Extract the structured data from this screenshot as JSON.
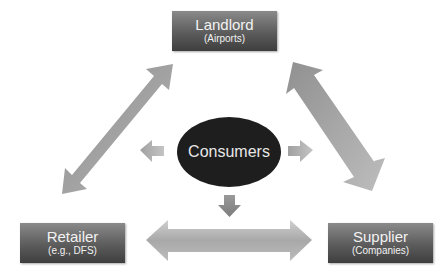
{
  "nodes": {
    "landlord": {
      "title": "Landlord",
      "subtitle": "(Airports)"
    },
    "retailer": {
      "title": "Retailer",
      "subtitle": "(e.g., DFS)"
    },
    "supplier": {
      "title": "Supplier",
      "subtitle": "(Companies)"
    },
    "consumers": {
      "title": "Consumers"
    }
  },
  "edges": [
    {
      "from": "landlord",
      "to": "retailer",
      "type": "bidirectional"
    },
    {
      "from": "landlord",
      "to": "supplier",
      "type": "bidirectional"
    },
    {
      "from": "retailer",
      "to": "supplier",
      "type": "bidirectional"
    },
    {
      "from": "consumers",
      "to": "retailer",
      "type": "directional",
      "direction": "left"
    },
    {
      "from": "consumers",
      "to": "supplier",
      "type": "directional",
      "direction": "right"
    },
    {
      "from": "consumers",
      "to": "retailer-supplier-link",
      "type": "directional",
      "direction": "down"
    }
  ],
  "colors": {
    "box_top": "#8a8a8a",
    "box_bottom": "#3e3e3e",
    "ellipse": "#1e1e1e",
    "arrow_light": "#c8c8c8",
    "arrow_dark": "#8c8c8c",
    "text": "#f2f2f2"
  }
}
